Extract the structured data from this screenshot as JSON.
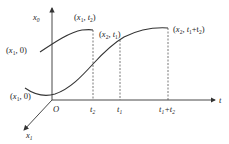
{
  "diagram": {
    "axes": {
      "vertical_label": "x",
      "vertical_sub": "0",
      "horizontal_label": "t",
      "diagonal_label": "x",
      "diagonal_sub": "1",
      "origin_label": "O"
    },
    "tick_labels": [
      {
        "main": "t",
        "sub": "2",
        "x": 93
      },
      {
        "main": "t",
        "sub": "1",
        "x": 120
      },
      {
        "main": "t",
        "sub": "1",
        "plus": "+t",
        "sub2": "2",
        "x": 168
      }
    ],
    "point_labels": {
      "left_upper": {
        "open": "(",
        "var": "x",
        "sub": "1",
        "rest": ", 0)"
      },
      "left_lower": {
        "open": "(",
        "var": "x",
        "sub": "1",
        "rest": ", 0)"
      },
      "top_peak": {
        "open": "(",
        "var": "x",
        "sub": "1",
        "comma": ", ",
        "t": "t",
        "tsub": "2",
        "close": ")"
      },
      "mid": {
        "open": "(",
        "var": "x",
        "sub": "2",
        "comma": ", ",
        "t": "t",
        "tsub": "1",
        "close": ")"
      },
      "right": {
        "open": "(",
        "var": "x",
        "sub": "2",
        "comma": ", ",
        "t": "t",
        "tsub": "1",
        "plus": "+t",
        "tsub2": "2",
        "close": ")"
      }
    },
    "colors": {
      "stroke": "#333333",
      "dash": "#555555"
    }
  }
}
